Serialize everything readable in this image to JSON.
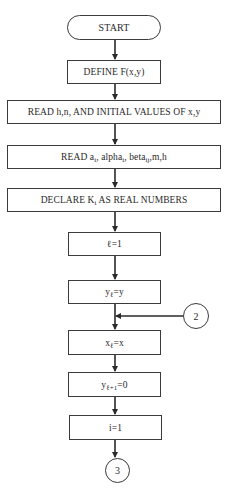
{
  "flowchart": {
    "nodes": {
      "start": {
        "shape": "terminal",
        "text": "START"
      },
      "define": {
        "shape": "process",
        "text": "DEFINE F(x,y)"
      },
      "read_initial": {
        "shape": "process",
        "text": "READ h,n, AND INITIAL VALUES OF x,y"
      },
      "read_params": {
        "shape": "process",
        "parts": {
          "p1": "READ a",
          "s1": "i",
          "p2": ", alpha",
          "s2": "i",
          "p3": ", beta",
          "s3": "ij",
          "p4": ",m,h"
        }
      },
      "declare": {
        "shape": "process",
        "parts": {
          "p1": "DECLARE K",
          "s1": "i",
          "p2": " AS REAL NUMBERS"
        }
      },
      "l_init": {
        "shape": "process",
        "text": "ℓ=1"
      },
      "y_l": {
        "shape": "process",
        "parts": {
          "p1": "y",
          "s1": "ℓ",
          "p2": "=y"
        }
      },
      "x_l": {
        "shape": "process",
        "parts": {
          "p1": "x",
          "s1": "ℓ",
          "p2": "=x"
        }
      },
      "y_l1": {
        "shape": "process",
        "parts": {
          "p1": "y",
          "s1": "ℓ+1",
          "p2": "=0"
        }
      },
      "i_init": {
        "shape": "process",
        "text": "i=1"
      }
    },
    "connectors": {
      "c2": {
        "label": "2"
      },
      "c3": {
        "label": "3"
      }
    },
    "colors": {
      "line": "#2a2a2a",
      "background": "#ffffff"
    }
  }
}
